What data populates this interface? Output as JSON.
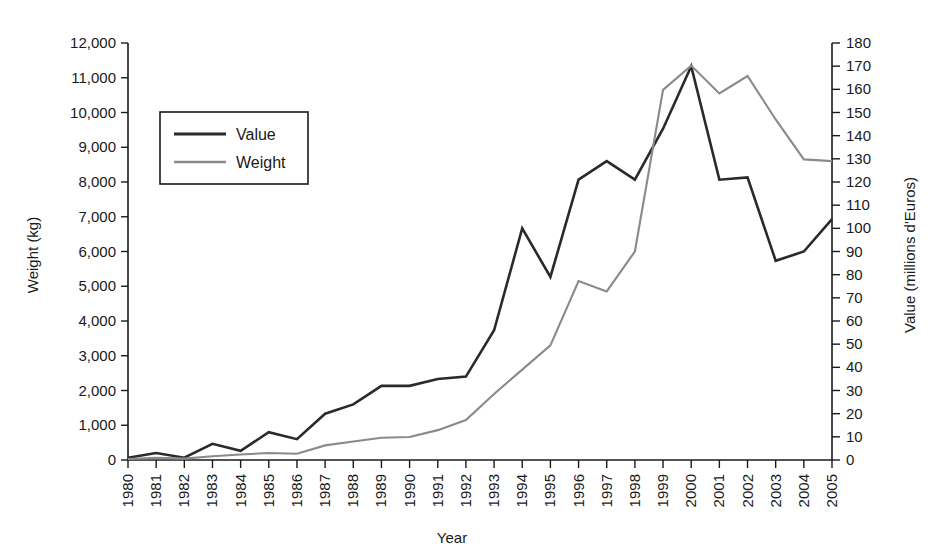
{
  "chart_data": {
    "type": "line",
    "title": "",
    "xlabel": "Year",
    "ylabel": "Weight (kg)",
    "y2label": "Value (millions d'Euros)",
    "grid": false,
    "legend_position": "upper-left-inside",
    "categories": [
      "1980",
      "1981",
      "1982",
      "1983",
      "1984",
      "1985",
      "1986",
      "1987",
      "1988",
      "1989",
      "1990",
      "1991",
      "1992",
      "1993",
      "1994",
      "1995",
      "1996",
      "1997",
      "1998",
      "1999",
      "2000",
      "2001",
      "2002",
      "2003",
      "2004",
      "2005"
    ],
    "x": [
      1980,
      1981,
      1982,
      1983,
      1984,
      1985,
      1986,
      1987,
      1988,
      1989,
      1990,
      1991,
      1992,
      1993,
      1994,
      1995,
      1996,
      1997,
      1998,
      1999,
      2000,
      2001,
      2002,
      2003,
      2004,
      2005
    ],
    "ylim": [
      0,
      12000
    ],
    "yticks": [
      0,
      1000,
      2000,
      3000,
      4000,
      5000,
      6000,
      7000,
      8000,
      9000,
      10000,
      11000,
      12000
    ],
    "ytick_labels": [
      "0",
      "1,000",
      "2,000",
      "3,000",
      "4,000",
      "5,000",
      "6,000",
      "7,000",
      "8,000",
      "9,000",
      "10,000",
      "11,000",
      "12,000"
    ],
    "y2lim": [
      0,
      180
    ],
    "y2ticks": [
      0,
      10,
      20,
      30,
      40,
      50,
      60,
      70,
      80,
      90,
      100,
      110,
      120,
      130,
      140,
      150,
      160,
      170,
      180
    ],
    "y2tick_labels": [
      "0",
      "10",
      "20",
      "30",
      "40",
      "50",
      "60",
      "70",
      "80",
      "90",
      "100",
      "110",
      "120",
      "130",
      "140",
      "150",
      "160",
      "170",
      "180"
    ],
    "series": [
      {
        "name": "Value",
        "axis": "right",
        "unit": "millions d'Euros",
        "color": "#2a2a2a",
        "line_width": 2.6,
        "values": [
          1,
          3,
          1,
          7,
          4,
          12,
          9,
          20,
          24,
          32,
          32,
          35,
          36,
          56,
          100,
          79,
          121,
          129,
          121,
          143,
          170,
          121,
          122,
          86,
          90,
          104
        ]
      },
      {
        "name": "Weight",
        "axis": "left",
        "unit": "kg",
        "color": "#8a8a8a",
        "line_width": 2.1,
        "values": [
          30,
          60,
          40,
          110,
          160,
          200,
          180,
          420,
          530,
          640,
          660,
          860,
          1150,
          1900,
          2600,
          3300,
          5150,
          4850,
          6000,
          10650,
          11350,
          10550,
          11050,
          9800,
          8650,
          8600
        ]
      }
    ]
  },
  "legend": {
    "items": [
      {
        "label": "Value",
        "color": "#2a2a2a"
      },
      {
        "label": "Weight",
        "color": "#8a8a8a"
      }
    ]
  }
}
